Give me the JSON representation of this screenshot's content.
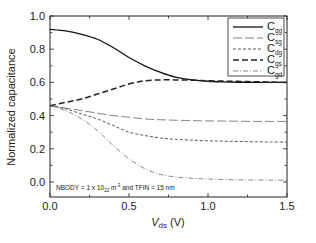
{
  "chart_data": {
    "type": "line",
    "title": "",
    "xlabel": "V_ds (V)",
    "xlabel_main": "V",
    "xlabel_sub": "ds",
    "xlabel_unit": " (V)",
    "ylabel": "Normalized capacitance",
    "xlim": [
      0.0,
      1.5
    ],
    "ylim": [
      -0.08,
      1.0
    ],
    "xticks": [
      "0.0",
      "0.5",
      "1.0",
      "1.5"
    ],
    "yticks": [
      "0.0",
      "0.2",
      "0.4",
      "0.6",
      "0.8",
      "1.0"
    ],
    "grid": false,
    "legend_position": "upper right",
    "annotation": {
      "prefix": "NBODY = 1 x 10",
      "sub": "22",
      "mid": " m",
      "sup": "-3",
      "suffix": " and TFIN = 15 nm"
    },
    "x": [
      0.0,
      0.1,
      0.2,
      0.3,
      0.4,
      0.5,
      0.6,
      0.7,
      0.8,
      0.9,
      1.0,
      1.1,
      1.2,
      1.3,
      1.4,
      1.5
    ],
    "series": [
      {
        "name": "C_gg",
        "main": "C",
        "sub": "gg",
        "style": "solid",
        "values": [
          0.92,
          0.91,
          0.89,
          0.86,
          0.81,
          0.75,
          0.7,
          0.66,
          0.63,
          0.615,
          0.607,
          0.603,
          0.601,
          0.6,
          0.6,
          0.6
        ]
      },
      {
        "name": "C_sg",
        "main": "C",
        "sub": "sg",
        "style": "longdash",
        "values": [
          0.46,
          0.445,
          0.43,
          0.415,
          0.4,
          0.39,
          0.38,
          0.375,
          0.372,
          0.37,
          0.368,
          0.367,
          0.366,
          0.365,
          0.365,
          0.365
        ]
      },
      {
        "name": "C_dg",
        "main": "C",
        "sub": "dg",
        "style": "shortdash",
        "values": [
          0.46,
          0.44,
          0.41,
          0.38,
          0.34,
          0.3,
          0.28,
          0.265,
          0.257,
          0.252,
          0.248,
          0.246,
          0.244,
          0.242,
          0.241,
          0.24
        ]
      },
      {
        "name": "C_gs",
        "main": "C",
        "sub": "gs",
        "style": "heavydash",
        "values": [
          0.46,
          0.48,
          0.5,
          0.53,
          0.56,
          0.59,
          0.61,
          0.615,
          0.615,
          0.613,
          0.61,
          0.608,
          0.606,
          0.604,
          0.602,
          0.6
        ]
      },
      {
        "name": "C_gd",
        "main": "C",
        "sub": "gd",
        "style": "dashdot",
        "values": [
          0.46,
          0.43,
          0.38,
          0.31,
          0.22,
          0.14,
          0.08,
          0.045,
          0.03,
          0.022,
          0.018,
          0.015,
          0.013,
          0.012,
          0.011,
          0.01
        ]
      }
    ]
  }
}
